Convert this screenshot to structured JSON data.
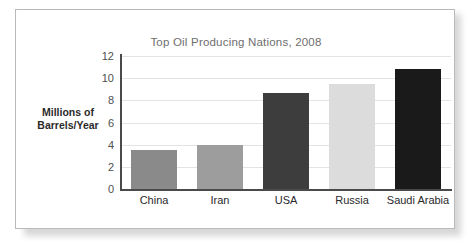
{
  "figure": {
    "title": "Top Oil Producing Nations, 2008"
  },
  "axes": {
    "y_label_line1": "Millions of",
    "y_label_line2": "Barrels/Year"
  },
  "chart_data": {
    "type": "bar",
    "title": "Top Oil Producing Nations, 2008",
    "xlabel": "",
    "ylabel": "Millions of Barrels/Year",
    "categories": [
      "China",
      "Iran",
      "USA",
      "Russia",
      "Saudi Arabia"
    ],
    "values": [
      3.5,
      4.0,
      8.7,
      9.5,
      10.8
    ],
    "bar_colors": [
      "#8a8a8a",
      "#9d9d9d",
      "#3d3d3d",
      "#dcdcdc",
      "#1a1a1a"
    ],
    "ylim": [
      0,
      12
    ],
    "yticks": [
      0,
      2,
      4,
      6,
      8,
      10,
      12
    ],
    "ytick_labels": [
      "0",
      "2",
      "4",
      "6",
      "8",
      "10",
      "12"
    ],
    "grid": true,
    "grid_axis": "y",
    "legend": false
  }
}
